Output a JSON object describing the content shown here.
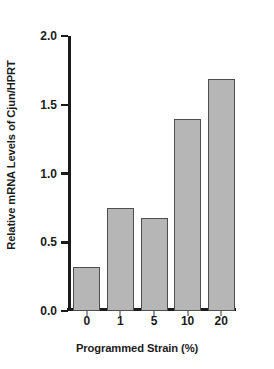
{
  "chart_data": {
    "type": "bar",
    "title": "",
    "subtitle": "",
    "categories": [
      "0",
      "1",
      "5",
      "10",
      "20"
    ],
    "values": [
      0.32,
      0.75,
      0.68,
      1.4,
      1.69
    ],
    "xlabel": "Programmed Strain (%)",
    "ylabel": "Relative mRNA Levels of Cjun/HPRT",
    "ylim": [
      0.0,
      2.0
    ],
    "ytick_labels": [
      "0.0",
      "0.5",
      "1.0",
      "1.5",
      "2.0"
    ],
    "ytick_values": [
      0.0,
      0.5,
      1.0,
      1.5,
      2.0
    ],
    "xtick_labels": [
      "0",
      "1",
      "5",
      "10",
      "20"
    ],
    "grid": false,
    "legend": null,
    "annotations": [],
    "colors": {
      "bar_fill": "#b6b6b6",
      "bar_edge": "#4e4e4e",
      "axis": "#1a1a1a",
      "text": "#1c1c1c",
      "background": "#ffffff"
    }
  }
}
